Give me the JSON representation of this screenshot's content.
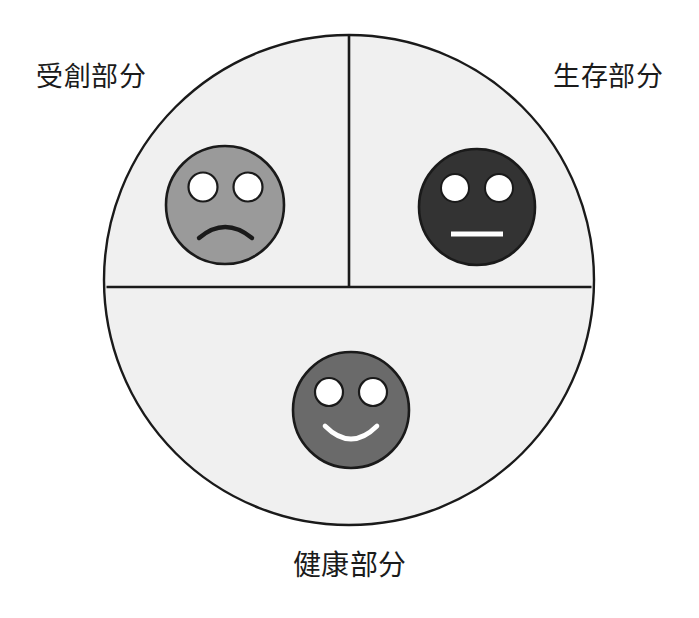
{
  "diagram": {
    "type": "quadrant-circle-with-faces",
    "background_color": "#ffffff",
    "circle": {
      "fill_color": "#f0f0f0",
      "stroke_color": "#1a1a1a",
      "center_x": 349,
      "center_y": 280,
      "radius": 245,
      "stroke_width": 2.4
    },
    "dividers": {
      "stroke_color": "#1a1a1a",
      "stroke_width": 2.6,
      "vertical": {
        "x": 349,
        "y_start": 35,
        "y_end": 287
      },
      "horizontal": {
        "y": 287,
        "x_start": 106,
        "x_end": 592
      }
    },
    "labels": {
      "wounded": "受創部分",
      "survival": "生存部分",
      "healthy": "健康部分",
      "text_color": "#1b1b1b"
    },
    "faces": [
      {
        "id": "sad-face",
        "expression": "sad",
        "quadrant": "top-left",
        "center_x": 225,
        "center_y": 205,
        "radius": 60,
        "fill_color": "#9a9a9a",
        "stroke_color": "#1a1a1a",
        "eye_color": "#ffffff",
        "eye_stroke_color": "#1a1a1a",
        "mouth_color": "#1a1a1a",
        "mouth_style": "frown-arc"
      },
      {
        "id": "neutral-face",
        "expression": "neutral",
        "quadrant": "top-right",
        "center_x": 477,
        "center_y": 207,
        "radius": 59,
        "fill_color": "#333333",
        "stroke_color": "#1a1a1a",
        "eye_color": "#ffffff",
        "eye_stroke_color": "#1a1a1a",
        "mouth_color": "#ffffff",
        "mouth_style": "straight-line"
      },
      {
        "id": "happy-face",
        "expression": "happy",
        "quadrant": "bottom",
        "center_x": 351,
        "center_y": 410,
        "radius": 59,
        "fill_color": "#6a6a6a",
        "stroke_color": "#1a1a1a",
        "eye_color": "#ffffff",
        "eye_stroke_color": "#1a1a1a",
        "mouth_color": "#ffffff",
        "mouth_style": "smile-arc"
      }
    ]
  }
}
